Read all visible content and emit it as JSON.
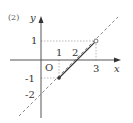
{
  "problem_label": "(2)",
  "axes": {
    "x_label": "x",
    "y_label": "y",
    "origin_label": "O"
  },
  "ticks": {
    "x_1": "1",
    "x_2": "2",
    "x_3": "3",
    "y_1": "1",
    "y_neg1": "-1",
    "y_neg2": "-2"
  },
  "graph": {
    "dashed_line": "y = x - 2",
    "segment": {
      "from": [
        1,
        -1
      ],
      "to": [
        3,
        1
      ],
      "from_endpoint": "closed",
      "to_endpoint": "open"
    },
    "colors": {
      "axis": "#555555",
      "line": "#333333",
      "dashed": "#777777",
      "guide": "#888888"
    }
  }
}
